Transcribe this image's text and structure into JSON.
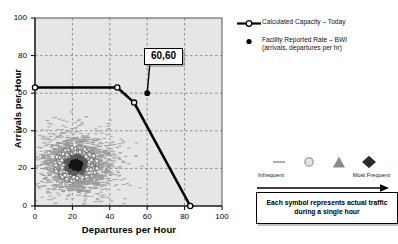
{
  "chart_data": {
    "type": "scatter",
    "title": "",
    "xlabel": "Departures per Hour",
    "ylabel": "Arrivals per Hour",
    "xlim": [
      0,
      100
    ],
    "ylim": [
      0,
      100
    ],
    "xticks": [
      0,
      20,
      40,
      60,
      80,
      100
    ],
    "yticks": [
      0,
      20,
      40,
      60,
      80,
      100
    ],
    "grid": true,
    "legend_position": "right",
    "series": [
      {
        "name": "Calculated Capacity – Today",
        "type": "line",
        "marker": "open-circle",
        "color": "#000000",
        "points": [
          {
            "x": 0,
            "y": 63
          },
          {
            "x": 44,
            "y": 63
          },
          {
            "x": 53,
            "y": 55
          },
          {
            "x": 83,
            "y": 0
          }
        ]
      },
      {
        "name": "Facility Reported Rate – BWI (arrivals, departures per hr)",
        "type": "point",
        "marker": "filled-circle",
        "color": "#000000",
        "points": [
          {
            "x": 60,
            "y": 60
          }
        ]
      },
      {
        "name": "Actual hourly traffic density cloud",
        "type": "density-scatter",
        "center": {
          "x": 22,
          "y": 22
        },
        "spread": {
          "x": 11,
          "y": 9
        },
        "n_points": 1400,
        "symbol_levels": [
          "dash",
          "open-circle",
          "triangle",
          "diamond"
        ]
      }
    ],
    "annotations": [
      {
        "text": "60,60",
        "points_to": {
          "x": 60,
          "y": 60
        },
        "style": "boxed-callout"
      }
    ]
  },
  "axes": {
    "y_title": "Arrivals per Hour",
    "x_title": "Departures per Hour",
    "y_tick_labels": [
      "100",
      "80",
      "60",
      "40",
      "20",
      "0"
    ],
    "x_tick_labels": [
      "0",
      "20",
      "40",
      "60",
      "80",
      "100"
    ]
  },
  "callout": {
    "label": "60,60"
  },
  "legend": {
    "items": [
      {
        "key": "line-open-circle",
        "label": "Calculated Capacity – Today",
        "sublabel": ""
      },
      {
        "key": "filled-dot",
        "label": "Facility Reported Rate – BWI",
        "sublabel": "(arrivals, departures per hr)"
      }
    ]
  },
  "frequency_scale": {
    "symbols": [
      "dash-symbol",
      "circle-symbol",
      "triangle-symbol",
      "diamond-symbol"
    ],
    "left_label": "Infrequent",
    "right_label": "Most Frequent",
    "note_line1": "Each symbol represents actual traffic",
    "note_line2": "during a single hour"
  },
  "colors": {
    "plot_background": "#e6e6e6",
    "gridline": "#7a7a7a",
    "axis": "#000000",
    "series_line": "#000000",
    "cloud_light": "#b8b8b8",
    "cloud_dark": "#1a1a1a"
  }
}
